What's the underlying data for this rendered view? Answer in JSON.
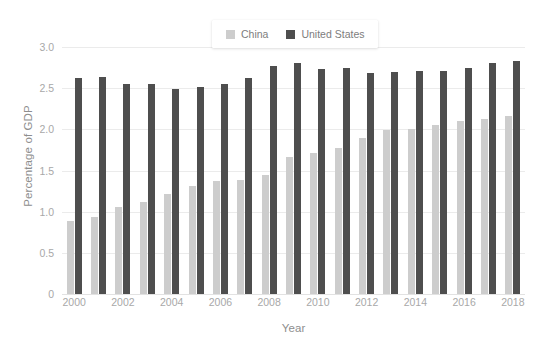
{
  "chart_data": {
    "type": "bar",
    "title": "",
    "xlabel": "Year",
    "ylabel": "Percentage of GDP",
    "categories": [
      "2000",
      "2001",
      "2002",
      "2003",
      "2004",
      "2005",
      "2006",
      "2007",
      "2008",
      "2009",
      "2010",
      "2011",
      "2012",
      "2013",
      "2014",
      "2015",
      "2016",
      "2017",
      "2018"
    ],
    "x_tick_labels": [
      "2000",
      "2002",
      "2004",
      "2006",
      "2008",
      "2010",
      "2012",
      "2014",
      "2016",
      "2018"
    ],
    "y_tick_labels": [
      "3.0",
      "2.5",
      "2.0",
      "1.5",
      "1.0",
      "0.5",
      "0"
    ],
    "y_tick_values": [
      3.0,
      2.5,
      2.0,
      1.5,
      1.0,
      0.5,
      0
    ],
    "ylim": [
      0,
      3.0
    ],
    "grid": true,
    "legend_position": "top-center",
    "series": [
      {
        "name": "China",
        "color": "#cdcdcd",
        "values": [
          0.89,
          0.94,
          1.06,
          1.12,
          1.21,
          1.31,
          1.37,
          1.38,
          1.44,
          1.66,
          1.71,
          1.77,
          1.9,
          1.99,
          2.01,
          2.05,
          2.1,
          2.13,
          2.16
        ]
      },
      {
        "name": "United States",
        "color": "#4e4e4e",
        "values": [
          2.62,
          2.64,
          2.55,
          2.55,
          2.49,
          2.51,
          2.55,
          2.62,
          2.77,
          2.81,
          2.73,
          2.75,
          2.68,
          2.7,
          2.71,
          2.71,
          2.75,
          2.8,
          2.83
        ]
      }
    ]
  },
  "legend": {
    "items": [
      {
        "label": "China",
        "color": "#cdcdcd"
      },
      {
        "label": "United States",
        "color": "#4e4e4e"
      }
    ]
  },
  "axes": {
    "y_title": "Percentage of GDP",
    "x_title": "Year"
  }
}
